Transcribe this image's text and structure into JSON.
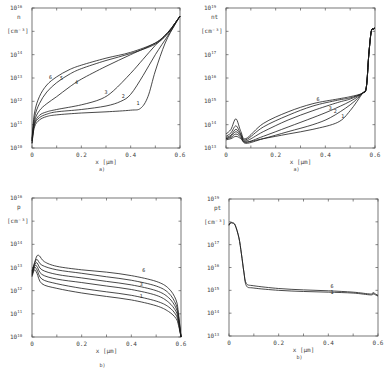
{
  "chart_data": [
    {
      "id": "n",
      "type": "line",
      "panel_caption": "a)",
      "title": "",
      "ylabel": "n",
      "yunit": "[cm-3]",
      "xlabel": "x [µm]",
      "yscale": "log",
      "ylim_exp": [
        10,
        16
      ],
      "ytick_labels": [
        "10^10",
        "10^11",
        "10^12",
        "10^13",
        "10^14",
        "10^16"
      ],
      "xlim": [
        0,
        0.6
      ],
      "xtick_labels": [
        "0",
        "0.2",
        "0.4",
        "0.6"
      ],
      "frame": {
        "x0": 32,
        "x1": 180,
        "y0": 8,
        "y1": 148
      },
      "curve_labels": [
        {
          "text": "6",
          "x": 0.075,
          "y": 12.95
        },
        {
          "text": "5",
          "x": 0.12,
          "y": 12.9
        },
        {
          "text": "4",
          "x": 0.18,
          "y": 12.75
        },
        {
          "text": "3",
          "x": 0.3,
          "y": 12.3
        },
        {
          "text": "2",
          "x": 0.37,
          "y": 12.15
        },
        {
          "text": "1",
          "x": 0.43,
          "y": 11.85
        }
      ],
      "series": [
        {
          "name": "1",
          "x": [
            0,
            0.01,
            0.03,
            0.06,
            0.1,
            0.2,
            0.3,
            0.4,
            0.44,
            0.47,
            0.5,
            0.54,
            0.58,
            0.6
          ],
          "y_exp": [
            10.2,
            10.9,
            11.2,
            11.35,
            11.42,
            11.5,
            11.55,
            11.62,
            11.7,
            12.2,
            13.3,
            14.5,
            15.3,
            15.65
          ]
        },
        {
          "name": "2",
          "x": [
            0,
            0.01,
            0.03,
            0.06,
            0.1,
            0.2,
            0.3,
            0.36,
            0.4,
            0.45,
            0.5,
            0.55,
            0.58,
            0.6
          ],
          "y_exp": [
            10.2,
            11.0,
            11.3,
            11.45,
            11.55,
            11.65,
            11.8,
            12.0,
            12.3,
            13.1,
            14.0,
            14.8,
            15.3,
            15.65
          ]
        },
        {
          "name": "3",
          "x": [
            0,
            0.01,
            0.03,
            0.06,
            0.1,
            0.2,
            0.28,
            0.33,
            0.4,
            0.45,
            0.5,
            0.55,
            0.58,
            0.6
          ],
          "y_exp": [
            10.3,
            11.05,
            11.4,
            11.55,
            11.65,
            11.85,
            12.1,
            12.45,
            13.2,
            13.8,
            14.4,
            14.95,
            15.35,
            15.65
          ]
        },
        {
          "name": "4",
          "x": [
            0,
            0.01,
            0.03,
            0.06,
            0.1,
            0.15,
            0.2,
            0.3,
            0.4,
            0.5,
            0.55,
            0.58,
            0.6
          ],
          "y_exp": [
            10.3,
            11.15,
            11.6,
            11.9,
            12.2,
            12.6,
            12.95,
            13.5,
            14.0,
            14.5,
            14.95,
            15.35,
            15.65
          ]
        },
        {
          "name": "5",
          "x": [
            0,
            0.01,
            0.03,
            0.06,
            0.1,
            0.15,
            0.2,
            0.3,
            0.4,
            0.5,
            0.55,
            0.58,
            0.6
          ],
          "y_exp": [
            10.35,
            11.3,
            11.9,
            12.4,
            12.8,
            13.15,
            13.4,
            13.75,
            14.05,
            14.45,
            14.9,
            15.35,
            15.65
          ]
        },
        {
          "name": "6",
          "x": [
            0,
            0.01,
            0.03,
            0.06,
            0.1,
            0.15,
            0.2,
            0.3,
            0.4,
            0.5,
            0.55,
            0.58,
            0.6
          ],
          "y_exp": [
            10.4,
            11.5,
            12.2,
            12.7,
            13.05,
            13.35,
            13.55,
            13.85,
            14.1,
            14.5,
            14.9,
            15.35,
            15.65
          ]
        }
      ]
    },
    {
      "id": "nt",
      "type": "line",
      "panel_caption": "a)",
      "title": "",
      "ylabel": "nt",
      "yunit": "[cm-3]",
      "xlabel": "x [µm]",
      "yscale": "log",
      "ylim_exp": [
        13,
        19
      ],
      "ytick_labels": [
        "10^13",
        "10^14",
        "10^15",
        "10^16",
        "10^17",
        "10^19"
      ],
      "xlim": [
        0,
        0.6
      ],
      "xtick_labels": [
        "0",
        "0.2",
        "0.4",
        "0.6"
      ],
      "frame": {
        "x0": 226,
        "x1": 375,
        "y0": 8,
        "y1": 148
      },
      "curve_labels": [
        {
          "text": "6",
          "x": 0.37,
          "y": 15.0
        },
        {
          "text": "3",
          "x": 0.42,
          "y": 14.62
        },
        {
          "text": "2",
          "x": 0.44,
          "y": 14.5
        },
        {
          "text": "1",
          "x": 0.47,
          "y": 14.3
        }
      ],
      "series": [
        {
          "name": "1",
          "x": [
            0,
            0.02,
            0.04,
            0.06,
            0.08,
            0.15,
            0.25,
            0.35,
            0.45,
            0.5,
            0.55,
            0.565,
            0.575,
            0.585,
            0.595,
            0.6
          ],
          "y_exp": [
            13.35,
            13.4,
            13.5,
            13.4,
            13.25,
            13.4,
            13.6,
            13.8,
            14.1,
            14.6,
            15.35,
            15.6,
            17.0,
            18.0,
            18.1,
            18.15
          ]
        },
        {
          "name": "2",
          "x": [
            0,
            0.02,
            0.04,
            0.06,
            0.08,
            0.15,
            0.25,
            0.35,
            0.42,
            0.5,
            0.55,
            0.565,
            0.575,
            0.585,
            0.595,
            0.6
          ],
          "y_exp": [
            13.4,
            13.45,
            13.6,
            13.45,
            13.2,
            13.4,
            13.7,
            14.0,
            14.3,
            14.85,
            15.35,
            15.6,
            17.0,
            18.0,
            18.1,
            18.15
          ]
        },
        {
          "name": "3",
          "x": [
            0,
            0.02,
            0.04,
            0.06,
            0.08,
            0.15,
            0.25,
            0.35,
            0.42,
            0.5,
            0.55,
            0.565,
            0.575,
            0.585,
            0.595,
            0.6
          ],
          "y_exp": [
            13.4,
            13.5,
            13.7,
            13.5,
            13.25,
            13.5,
            13.9,
            14.3,
            14.6,
            15.0,
            15.35,
            15.6,
            17.0,
            18.0,
            18.1,
            18.15
          ]
        },
        {
          "name": "4",
          "x": [
            0,
            0.02,
            0.04,
            0.06,
            0.08,
            0.15,
            0.25,
            0.35,
            0.45,
            0.5,
            0.55,
            0.565,
            0.575,
            0.585,
            0.595,
            0.6
          ],
          "y_exp": [
            13.45,
            13.55,
            13.8,
            13.55,
            13.3,
            13.7,
            14.2,
            14.6,
            14.95,
            15.1,
            15.35,
            15.6,
            17.0,
            18.0,
            18.1,
            18.15
          ]
        },
        {
          "name": "5",
          "x": [
            0,
            0.02,
            0.04,
            0.06,
            0.08,
            0.15,
            0.25,
            0.35,
            0.45,
            0.5,
            0.55,
            0.565,
            0.575,
            0.585,
            0.595,
            0.6
          ],
          "y_exp": [
            13.5,
            13.65,
            13.95,
            13.6,
            13.35,
            13.9,
            14.4,
            14.8,
            15.05,
            15.15,
            15.35,
            15.6,
            17.0,
            18.0,
            18.1,
            18.15
          ]
        },
        {
          "name": "6",
          "x": [
            0,
            0.02,
            0.04,
            0.06,
            0.08,
            0.15,
            0.25,
            0.35,
            0.45,
            0.5,
            0.55,
            0.565,
            0.575,
            0.585,
            0.595,
            0.6
          ],
          "y_exp": [
            13.6,
            13.8,
            14.25,
            13.7,
            13.4,
            14.05,
            14.55,
            14.9,
            15.1,
            15.2,
            15.35,
            15.6,
            17.0,
            18.0,
            18.1,
            18.15
          ]
        }
      ]
    },
    {
      "id": "p",
      "type": "line",
      "panel_caption": "b)",
      "title": "",
      "ylabel": "p",
      "yunit": "[cm-3]",
      "xlabel": "x [µm]",
      "yscale": "log",
      "ylim_exp": [
        10,
        16
      ],
      "ytick_labels": [
        "10^10",
        "10^11",
        "10^12",
        "10^13",
        "10^14",
        "10^16"
      ],
      "xlim": [
        0,
        0.6
      ],
      "xtick_labels": [
        "0",
        "0.2",
        "0.4",
        "0.6"
      ],
      "frame": {
        "x0": 32,
        "x1": 181,
        "y0": 198,
        "y1": 337
      },
      "curve_labels": [
        {
          "text": "6",
          "x": 0.45,
          "y": 12.8
        },
        {
          "text": "3",
          "x": 0.44,
          "y": 12.2
        },
        {
          "text": "1",
          "x": 0.44,
          "y": 11.7
        }
      ],
      "series": [
        {
          "name": "1",
          "x": [
            0,
            0.01,
            0.02,
            0.04,
            0.1,
            0.2,
            0.3,
            0.4,
            0.5,
            0.55,
            0.58,
            0.59,
            0.6
          ],
          "y_exp": [
            12.6,
            12.9,
            12.75,
            12.3,
            12.1,
            11.9,
            11.75,
            11.6,
            11.35,
            11.1,
            10.8,
            10.5,
            10.0
          ]
        },
        {
          "name": "2",
          "x": [
            0,
            0.01,
            0.02,
            0.04,
            0.1,
            0.2,
            0.3,
            0.4,
            0.5,
            0.55,
            0.58,
            0.59,
            0.6
          ],
          "y_exp": [
            12.65,
            13.0,
            12.9,
            12.5,
            12.3,
            12.1,
            11.95,
            11.8,
            11.55,
            11.3,
            10.95,
            10.6,
            10.0
          ]
        },
        {
          "name": "3",
          "x": [
            0,
            0.01,
            0.02,
            0.04,
            0.1,
            0.2,
            0.3,
            0.4,
            0.5,
            0.55,
            0.58,
            0.59,
            0.6
          ],
          "y_exp": [
            12.7,
            13.05,
            13.05,
            12.7,
            12.5,
            12.35,
            12.2,
            12.05,
            11.8,
            11.5,
            11.1,
            10.7,
            10.0
          ]
        },
        {
          "name": "4",
          "x": [
            0,
            0.01,
            0.02,
            0.04,
            0.1,
            0.2,
            0.3,
            0.4,
            0.5,
            0.55,
            0.58,
            0.59,
            0.6
          ],
          "y_exp": [
            12.75,
            13.1,
            13.2,
            12.9,
            12.7,
            12.55,
            12.4,
            12.25,
            12.0,
            11.7,
            11.25,
            10.8,
            10.0
          ]
        },
        {
          "name": "5",
          "x": [
            0,
            0.01,
            0.02,
            0.04,
            0.1,
            0.2,
            0.3,
            0.4,
            0.5,
            0.55,
            0.58,
            0.59,
            0.6
          ],
          "y_exp": [
            12.8,
            13.15,
            13.35,
            13.1,
            12.9,
            12.75,
            12.6,
            12.45,
            12.2,
            11.9,
            11.4,
            10.9,
            10.0
          ]
        },
        {
          "name": "6",
          "x": [
            0,
            0.01,
            0.02,
            0.03,
            0.05,
            0.1,
            0.2,
            0.3,
            0.4,
            0.5,
            0.55,
            0.58,
            0.59,
            0.6
          ],
          "y_exp": [
            12.85,
            13.2,
            13.5,
            13.5,
            13.25,
            13.05,
            12.9,
            12.8,
            12.65,
            12.4,
            12.1,
            11.6,
            11.0,
            10.0
          ]
        }
      ]
    },
    {
      "id": "pt",
      "type": "line",
      "panel_caption": "b)",
      "title": "",
      "ylabel": "pt",
      "yunit": "[cm-3]",
      "xlabel": "x [µm]",
      "yscale": "log",
      "ylim_exp": [
        13,
        19
      ],
      "ytick_labels": [
        "10^13",
        "10^14",
        "10^15",
        "10^16",
        "10^17",
        "10^19"
      ],
      "xlim": [
        0,
        0.6
      ],
      "xtick_labels": [
        "0",
        "0.2",
        "0.4",
        "0.6"
      ],
      "frame": {
        "x0": 229,
        "x1": 378,
        "y0": 199,
        "y1": 336
      },
      "curve_labels": [
        {
          "text": "6",
          "x": 0.415,
          "y": 15.12
        },
        {
          "text": "1",
          "x": 0.415,
          "y": 14.82
        }
      ],
      "series": [
        {
          "name": "1",
          "x": [
            0,
            0.005,
            0.015,
            0.025,
            0.04,
            0.05,
            0.06,
            0.07,
            0.1,
            0.2,
            0.3,
            0.4,
            0.5,
            0.57,
            0.58,
            0.59,
            0.6
          ],
          "y_exp": [
            17.85,
            17.95,
            17.95,
            17.85,
            17.3,
            16.6,
            15.8,
            15.2,
            15.1,
            15.0,
            14.95,
            14.92,
            14.88,
            14.8,
            14.85,
            14.8,
            14.75
          ]
        },
        {
          "name": "6",
          "x": [
            0,
            0.005,
            0.015,
            0.025,
            0.04,
            0.05,
            0.06,
            0.07,
            0.1,
            0.2,
            0.3,
            0.4,
            0.5,
            0.57,
            0.58,
            0.59,
            0.6
          ],
          "y_exp": [
            17.85,
            17.95,
            17.95,
            17.85,
            17.3,
            16.6,
            15.8,
            15.3,
            15.2,
            15.08,
            15.02,
            14.98,
            14.92,
            14.84,
            14.9,
            14.84,
            14.78
          ]
        }
      ]
    }
  ]
}
